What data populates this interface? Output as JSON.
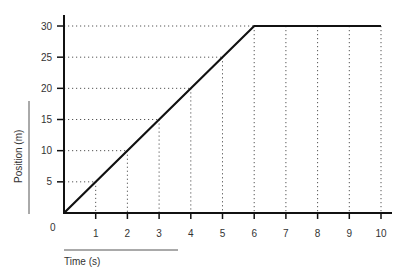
{
  "chart_data": {
    "type": "line",
    "title": "",
    "xlabel": "Time (s)",
    "ylabel": "Position (m)",
    "x": [
      0,
      6,
      10
    ],
    "series": [
      {
        "name": "Position",
        "x": [
          0,
          6,
          10
        ],
        "values": [
          0,
          30,
          30
        ]
      }
    ],
    "xticks": [
      "1",
      "2",
      "3",
      "4",
      "5",
      "6",
      "7",
      "8",
      "9",
      "10"
    ],
    "yticks": [
      "5",
      "10",
      "15",
      "20",
      "25",
      "30"
    ],
    "origin_label": "0",
    "xlim": [
      0,
      10.5
    ],
    "ylim": [
      0,
      30
    ],
    "grid": "dotted drop-lines from line to axes",
    "legend": "none"
  },
  "colors": {
    "line": "#111111",
    "axis": "#111111",
    "grid": "#555555",
    "text": "#333333"
  }
}
